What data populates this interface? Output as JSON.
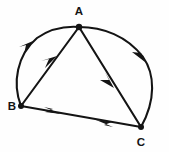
{
  "figure": {
    "background_color": "#fefefe",
    "stroke_color": "#141414",
    "canvas": {
      "width": 169,
      "height": 152
    },
    "vertices": [
      {
        "id": "A",
        "label": "A",
        "x": 79,
        "y": 27,
        "label_x": 79,
        "label_y": 15
      },
      {
        "id": "B",
        "label": "B",
        "x": 21,
        "y": 106,
        "label_x": 12,
        "label_y": 110
      },
      {
        "id": "C",
        "label": "C",
        "x": 141,
        "y": 127,
        "label_x": 141,
        "label_y": 145
      }
    ],
    "circle": {
      "center_x": 85,
      "center_y": 86,
      "radius_x": 72,
      "radius_y": 60
    },
    "edges": [
      {
        "id": "arc-BA",
        "kind": "arc",
        "from": "B",
        "to": "A",
        "direction": "B-to-A",
        "arrow_at": "midpoint"
      },
      {
        "id": "arc-AC",
        "kind": "arc",
        "from": "A",
        "to": "C",
        "direction": "A-to-C",
        "arrow_at": "midpoint"
      },
      {
        "id": "chord-BA",
        "kind": "chord",
        "from": "B",
        "to": "A",
        "direction": "B-to-A",
        "arrow_at": "midpoint"
      },
      {
        "id": "chord-AC",
        "kind": "chord",
        "from": "A",
        "to": "C",
        "direction": "A-to-C",
        "arrow_at": "midpoint"
      },
      {
        "id": "chord-BC",
        "kind": "chord",
        "from": "B",
        "to": "C",
        "direction": "bidirectional",
        "arrow_at": "both"
      }
    ]
  }
}
